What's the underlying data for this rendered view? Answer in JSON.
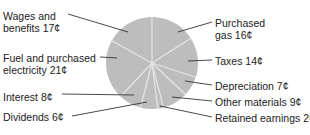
{
  "chart_data": {
    "type": "pie",
    "title": "",
    "unit": "¢",
    "start_angle_deg": 0,
    "direction": "clockwise",
    "slice_color": "#bdbdbd",
    "separator_color": "#e6e6e6",
    "leader_color": "#333333",
    "center": [
      152,
      63
    ],
    "radius": 46,
    "categories": [
      "Purchased gas",
      "Taxes",
      "Depreciation",
      "Other materials",
      "Retained earnings",
      "Dividends",
      "Interest",
      "Fuel and purchased electricity",
      "Wages and benefits"
    ],
    "values": [
      16,
      14,
      7,
      9,
      2,
      6,
      8,
      21,
      17
    ],
    "labels": [
      {
        "line1": "Purchased",
        "line2": "gas 16¢",
        "x": 215,
        "y": 17,
        "anchor": [
          178,
          32
        ],
        "end": [
          212,
          22
        ]
      },
      {
        "line1": "Taxes 14¢",
        "line2": "",
        "x": 215,
        "y": 55,
        "anchor": [
          188,
          61
        ],
        "end": [
          212,
          60
        ]
      },
      {
        "line1": "Depreciation 7¢",
        "line2": "",
        "x": 215,
        "y": 80,
        "anchor": [
          185,
          81
        ],
        "end": [
          212,
          85
        ]
      },
      {
        "line1": "Other materials 9¢",
        "line2": "",
        "x": 215,
        "y": 96,
        "anchor": [
          172,
          97
        ],
        "end": [
          212,
          101
        ]
      },
      {
        "line1": "Retained earnings 2¢",
        "line2": "",
        "x": 215,
        "y": 112,
        "anchor": [
          160,
          106
        ],
        "end": [
          212,
          117
        ]
      },
      {
        "line1": "Dividends 6¢",
        "line2": "",
        "x": 3,
        "y": 111,
        "anchor": [
          147,
          102
        ],
        "end": [
          72,
          116
        ]
      },
      {
        "line1": "Interest 8¢",
        "line2": "",
        "x": 3,
        "y": 91,
        "anchor": [
          134,
          95
        ],
        "end": [
          62,
          94
        ]
      },
      {
        "line1": "Fuel and purchased",
        "line2": "electricity 21¢",
        "x": 3,
        "y": 52,
        "anchor": [
          117,
          58
        ],
        "end": [
          100,
          57
        ]
      },
      {
        "line1": "Wages and",
        "line2": "benefits 17¢",
        "x": 3,
        "y": 10,
        "anchor": [
          128,
          32
        ],
        "end": [
          68,
          14
        ]
      }
    ]
  }
}
